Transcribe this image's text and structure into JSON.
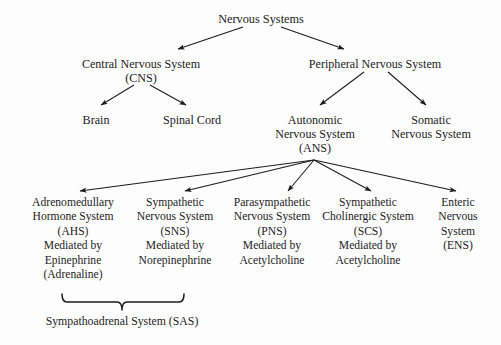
{
  "diagram": {
    "title": "Nervous Systems",
    "type": "hierarchy-tree",
    "background_color": "#fdfdfd",
    "line_color": "#1c1c1c",
    "text_color": "#1c1c1c"
  },
  "nodes": {
    "root": {
      "lines": [
        "Nervous Systems"
      ],
      "x": 261,
      "y": 12
    },
    "cns": {
      "lines": [
        "Central Nervous System",
        "(CNS)"
      ],
      "x": 141,
      "y": 57
    },
    "pns_peripheral": {
      "lines": [
        "Peripheral Nervous System"
      ],
      "x": 375,
      "y": 57
    },
    "brain": {
      "lines": [
        "Brain"
      ],
      "x": 96,
      "y": 113
    },
    "spinal_cord": {
      "lines": [
        "Spinal Cord"
      ],
      "x": 192,
      "y": 113
    },
    "autonomic": {
      "lines": [
        "Autonomic",
        "Nervous System",
        "(ANS)"
      ],
      "x": 315,
      "y": 113
    },
    "somatic": {
      "lines": [
        "Somatic",
        "Nervous System"
      ],
      "x": 431,
      "y": 113
    }
  },
  "branches": [
    {
      "id": "ahs",
      "x": 73,
      "y": 196,
      "lines": [
        "Adrenomedullary",
        "Hormone System",
        "(AHS)",
        "Mediated by",
        "Epinephrine",
        "(Adrenaline)"
      ]
    },
    {
      "id": "sns",
      "x": 175,
      "y": 196,
      "lines": [
        "Sympathetic",
        "Nervous System",
        "(SNS)",
        "Mediated by",
        "Norepinephrine"
      ]
    },
    {
      "id": "pns",
      "x": 272,
      "y": 196,
      "lines": [
        "Parasympathetic",
        "Nervous System",
        "(PNS)",
        "Mediated by",
        "Acetylcholine"
      ]
    },
    {
      "id": "scs",
      "x": 368,
      "y": 196,
      "lines": [
        "Sympathetic",
        "Cholinergic System",
        "(SCS)",
        "Mediated by",
        "Acetylcholine"
      ]
    },
    {
      "id": "ens",
      "x": 458,
      "y": 196,
      "lines": [
        "Enteric",
        "Nervous",
        "System",
        "(ENS)"
      ]
    }
  ],
  "bracket": {
    "label": "Sympathoadrenal  System (SAS)",
    "label_x": 122,
    "label_y": 314,
    "left_x": 62,
    "right_x": 184,
    "tick_x": 122,
    "top_y": 294,
    "bottom_y": 302,
    "tick_y": 310
  },
  "edges": [
    {
      "id": "root-to-cns",
      "from": "Nervous Systems",
      "to": "Central Nervous System",
      "x1": 243,
      "y1": 27,
      "x2": 178,
      "y2": 49
    },
    {
      "id": "root-to-peripheral",
      "from": "Nervous Systems",
      "to": "Peripheral Nervous System",
      "x1": 281,
      "y1": 27,
      "x2": 344,
      "y2": 49
    },
    {
      "id": "cns-to-brain",
      "from": "Central Nervous System",
      "to": "Brain",
      "x1": 134,
      "y1": 85,
      "x2": 101,
      "y2": 105
    },
    {
      "id": "cns-to-spinal",
      "from": "Central Nervous System",
      "to": "Spinal Cord",
      "x1": 150,
      "y1": 85,
      "x2": 186,
      "y2": 105
    },
    {
      "id": "peripheral-to-ans",
      "from": "Peripheral Nervous System",
      "to": "Autonomic Nervous System",
      "x1": 364,
      "y1": 72,
      "x2": 320,
      "y2": 105
    },
    {
      "id": "peripheral-to-sns",
      "from": "Peripheral Nervous System",
      "to": "Somatic Nervous System",
      "x1": 388,
      "y1": 72,
      "x2": 426,
      "y2": 105
    },
    {
      "id": "ans-to-ahs",
      "from": "Autonomic Nervous System",
      "to": "Adrenomedullary Hormone System",
      "x1": 314,
      "y1": 160,
      "x2": 80,
      "y2": 191
    },
    {
      "id": "ans-to-sns",
      "from": "Autonomic Nervous System",
      "to": "Sympathetic Nervous System",
      "x1": 314,
      "y1": 160,
      "x2": 185,
      "y2": 191
    },
    {
      "id": "ans-to-pns",
      "from": "Autonomic Nervous System",
      "to": "Parasympathetic Nervous System",
      "x1": 314,
      "y1": 160,
      "x2": 288,
      "y2": 191
    },
    {
      "id": "ans-to-scs",
      "from": "Autonomic Nervous System",
      "to": "Sympathetic Cholinergic System",
      "x1": 314,
      "y1": 160,
      "x2": 371,
      "y2": 191
    },
    {
      "id": "ans-to-ens",
      "from": "Autonomic Nervous System",
      "to": "Enteric Nervous System",
      "x1": 314,
      "y1": 160,
      "x2": 456,
      "y2": 191
    }
  ]
}
